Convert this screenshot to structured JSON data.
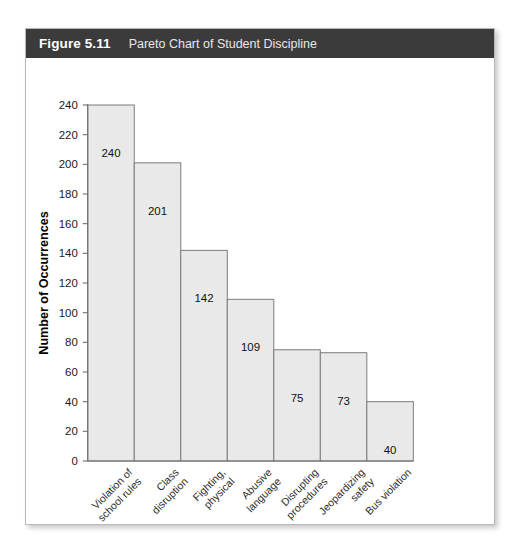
{
  "figure": {
    "number_label": "Figure 5.11",
    "title": "Pareto Chart of Student Discipline"
  },
  "chart_data": {
    "type": "bar",
    "title": "Pareto Chart of Student Discipline",
    "xlabel": "",
    "ylabel": "Number of Occurrences",
    "ylim": [
      0,
      240
    ],
    "ytick_step": 20,
    "yticks": [
      0,
      20,
      40,
      60,
      80,
      100,
      120,
      140,
      160,
      180,
      200,
      220,
      240
    ],
    "ytick_labels": [
      "0",
      "20",
      "40",
      "60",
      "80",
      "100",
      "120",
      "140",
      "160",
      "180",
      "200",
      "220",
      "240"
    ],
    "grid": false,
    "legend": false,
    "bar_gap": 0,
    "bar_fill": "#e9e9e9",
    "bar_stroke": "#7c7c7c",
    "categories": [
      "Violation of school rules",
      "Class disruption",
      "Fighting, physical",
      "Abusive language",
      "Disrupting procedures",
      "Jeopardizing safety",
      "Bus violation"
    ],
    "category_lines": [
      [
        "Violation of",
        "school rules"
      ],
      [
        "Class",
        "disruption"
      ],
      [
        "Fighting,",
        "physical"
      ],
      [
        "Abusive",
        "language"
      ],
      [
        "Disrupting",
        "procedures"
      ],
      [
        "Jeopardizing",
        "safety"
      ],
      [
        "Bus violation"
      ]
    ],
    "values": [
      240,
      201,
      142,
      109,
      75,
      73,
      40
    ],
    "value_labels": [
      "240",
      "201",
      "142",
      "109",
      "75",
      "73",
      "40"
    ]
  },
  "colors": {
    "header_bar": "#3b3b3b",
    "card_border": "#b9b9b9",
    "axis": "#6e6e6e",
    "bar_fill": "#e9e9e9",
    "bar_stroke": "#7c7c7c"
  }
}
